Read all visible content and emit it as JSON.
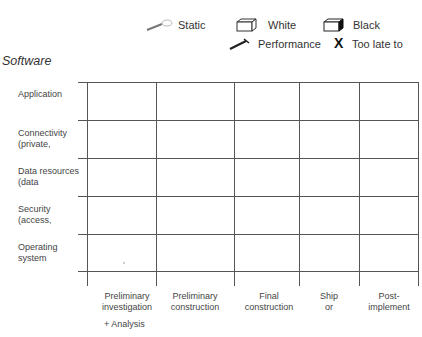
{
  "legend": {
    "items": [
      {
        "icon": "static-icon",
        "label": "Static"
      },
      {
        "icon": "white-box-icon",
        "label": "White"
      },
      {
        "icon": "black-box-icon",
        "label": "Black"
      },
      {
        "icon": "performance-icon",
        "label": "Performance"
      },
      {
        "icon": "x-icon",
        "label": "Too late to",
        "glyph": "X"
      }
    ]
  },
  "title": "Software",
  "rows": [
    {
      "line1": "Application",
      "line2": ""
    },
    {
      "line1": "Connectivity",
      "line2": "(private,"
    },
    {
      "line1": "Data resources",
      "line2": "(data"
    },
    {
      "line1": "Security",
      "line2": "(access,"
    },
    {
      "line1": "Operating",
      "line2": "system"
    }
  ],
  "columns": [
    {
      "line1": "Preliminary",
      "line2": "investigation"
    },
    {
      "line1": "Preliminary",
      "line2": "construction"
    },
    {
      "line1": "Final",
      "line2": "construction"
    },
    {
      "line1": "Ship",
      "line2": "or"
    },
    {
      "line1": "Post-",
      "line2": "implement"
    }
  ],
  "footnote": "+ Analysis",
  "colors": {
    "line": "#555555",
    "text": "#333333"
  }
}
